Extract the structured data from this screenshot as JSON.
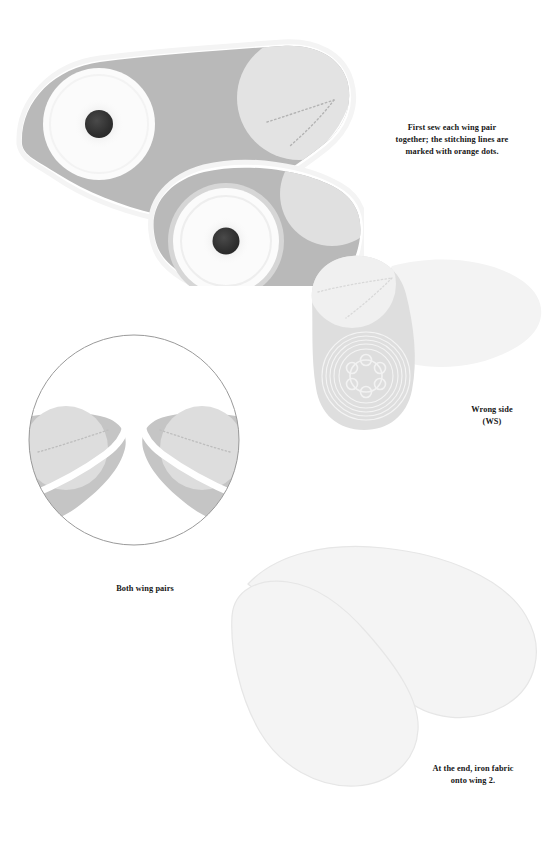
{
  "document": {
    "kind": "sewing-instruction-sheet",
    "page_background": "#ffffff",
    "width": 558,
    "height": 844
  },
  "palette": {
    "fabric_gray": "#b9b9b9",
    "fabric_gray_light": "#cccccc",
    "fabric_patch": "#e4e4e4",
    "fabric_pale": "#efefef",
    "eye_white": "#fbfbfb",
    "pupil_dark": "#2f2f2f",
    "ring_gray": "#d2d2d2",
    "stitch_dot": "#b0b0b0",
    "outline_faint": "#e7e7e7",
    "inset_border": "#8a8a8a",
    "text_color": "#161616"
  },
  "captions": {
    "step1": "First sew each wing pair\ntogether; the stitching lines are\nmarked with orange dots.",
    "wrong_side": "Wrong side\n(WS)",
    "both_wing_pairs": "Both wing pairs",
    "final_step": "At the end, iron fabric\nonto wing 2."
  },
  "illustrations": {
    "main": {
      "name": "sewn-wing-pair-top-view",
      "parts": [
        "wing-body-left",
        "wing-body-right",
        "eye-disc-left",
        "eye-disc-right",
        "pupil-left",
        "pupil-right",
        "stitch-line-dotted"
      ]
    },
    "wrong_side": {
      "name": "wing-wrong-side-view",
      "parts": [
        "wing-body-pale",
        "concentric-rings",
        "stitch-line-dotted",
        "fabric-overlay-pale"
      ]
    },
    "inset": {
      "name": "both-wing-pairs-circular-inset",
      "parts": [
        "circle-frame",
        "wing-tip-left",
        "wing-tip-right",
        "stitch-line-dotted-left",
        "stitch-line-dotted-right"
      ]
    },
    "final": {
      "name": "ironed-fabric-wing-outline",
      "parts": [
        "wing-outline-upper",
        "wing-outline-lower"
      ]
    }
  }
}
